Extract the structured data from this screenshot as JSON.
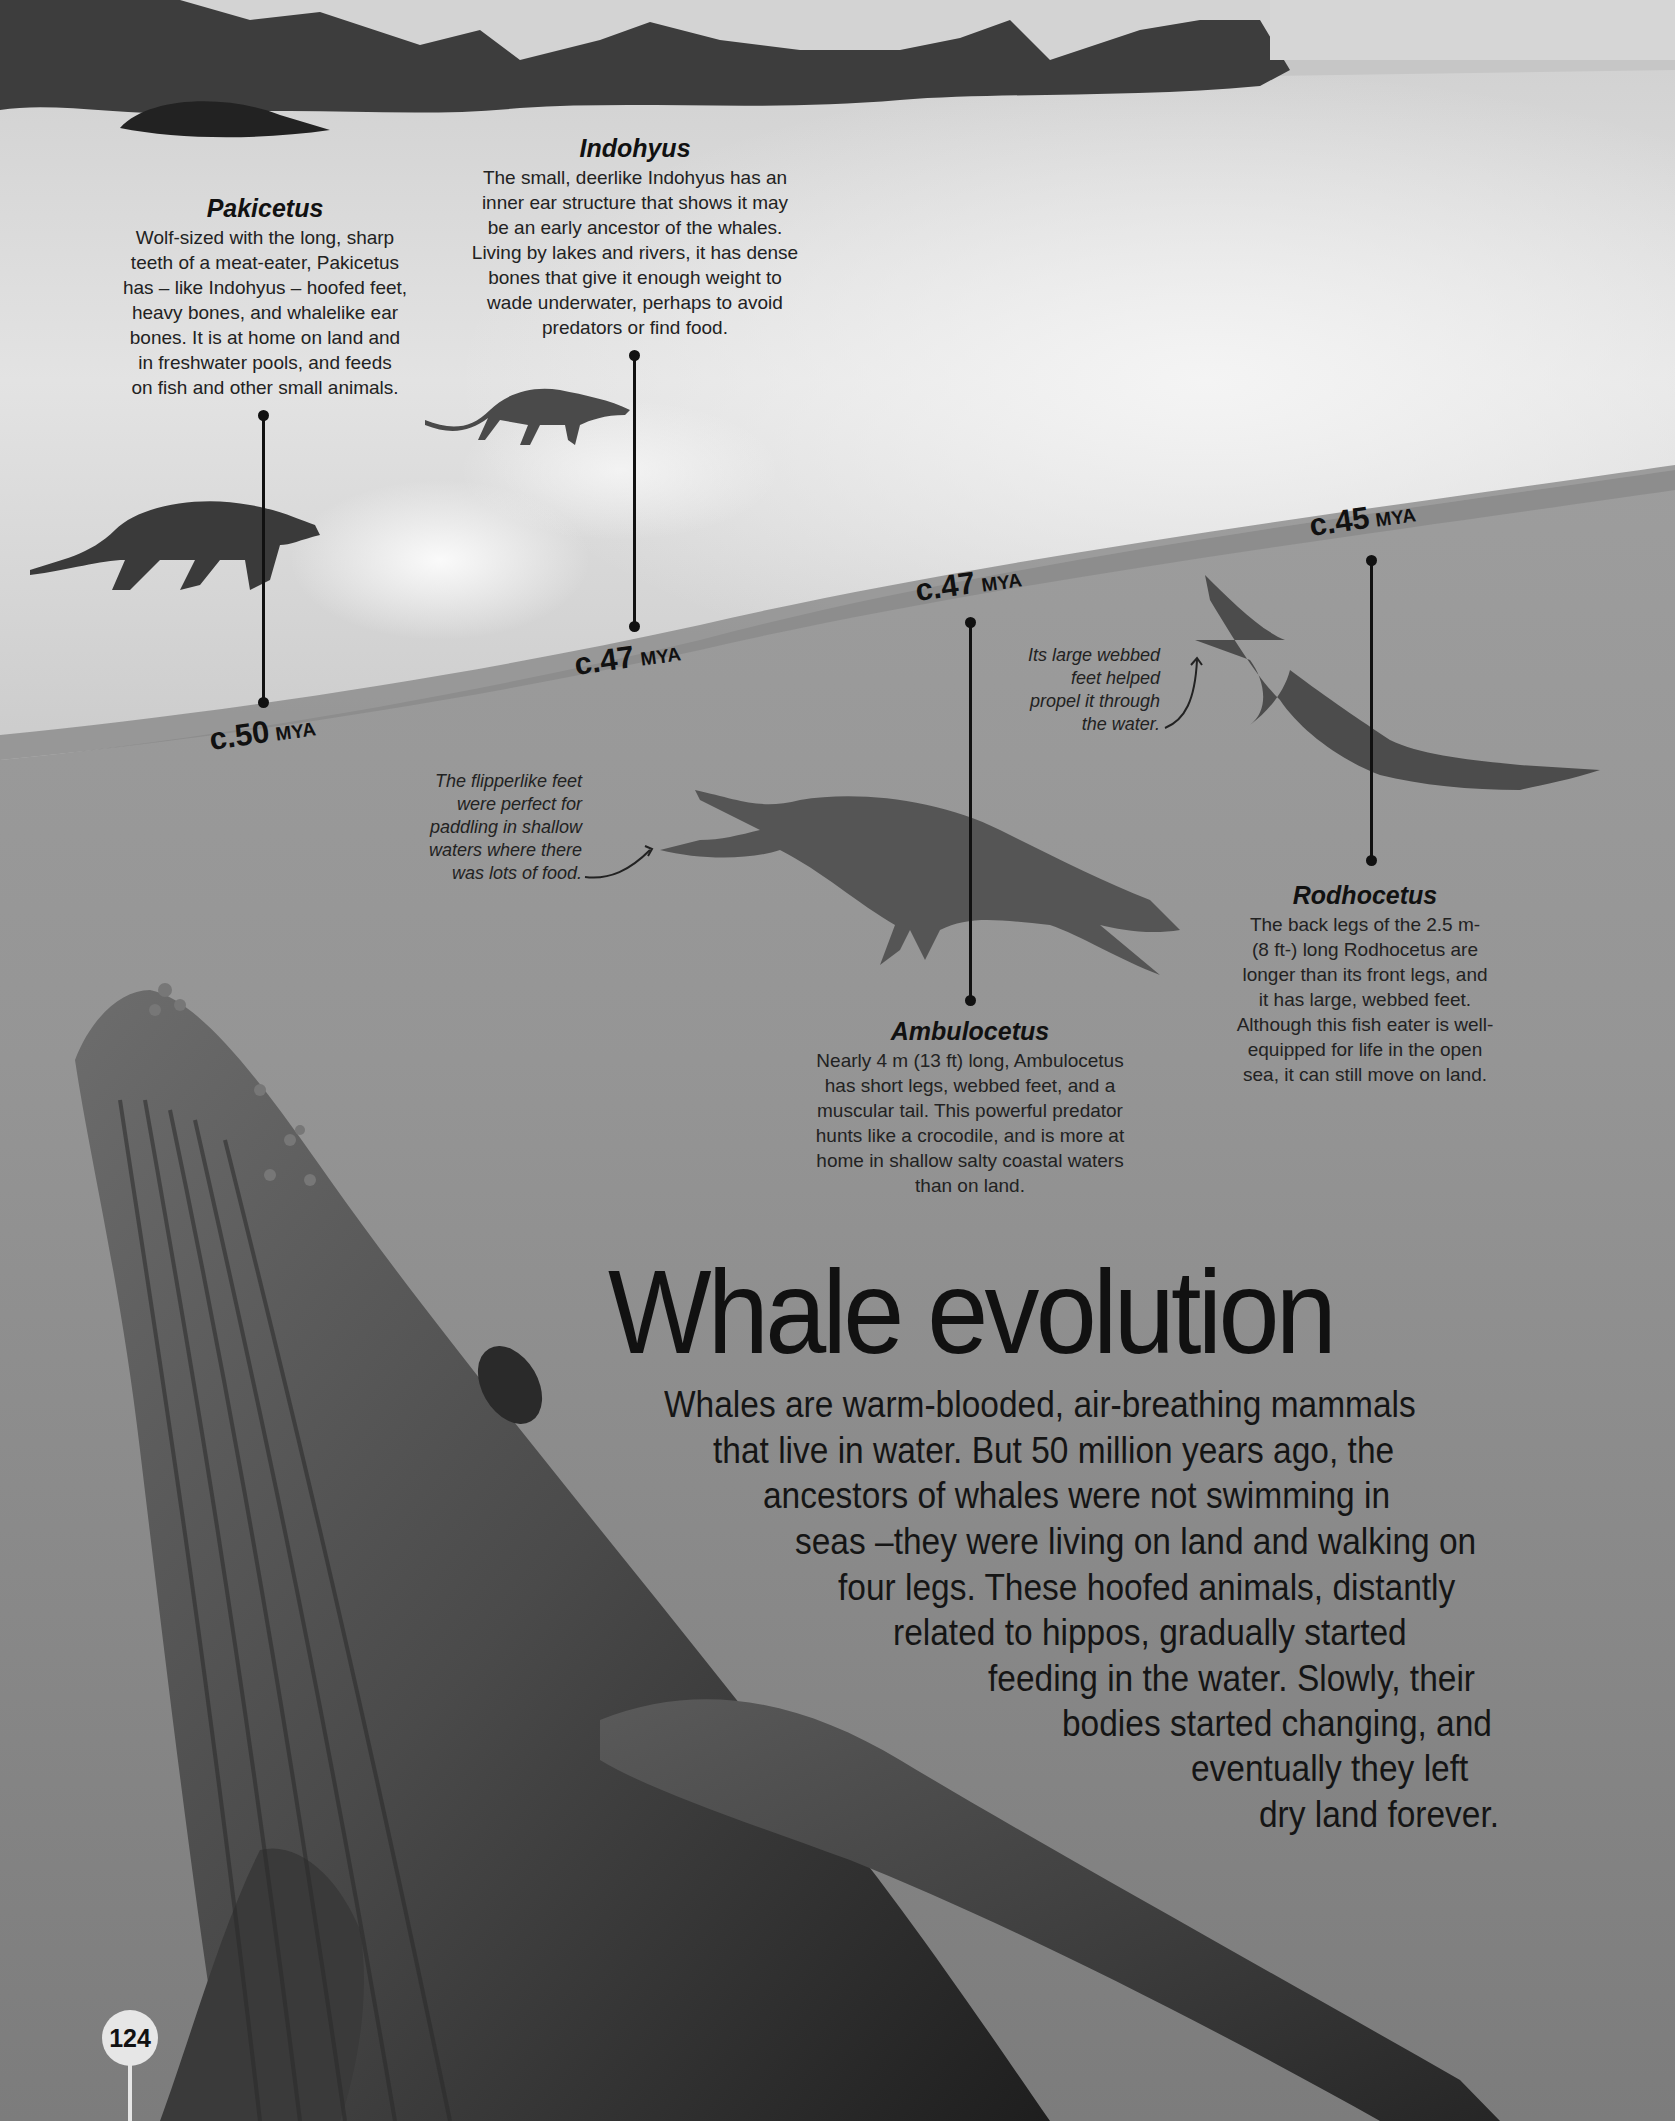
{
  "page": {
    "title": "Whale evolution",
    "page_number": "124",
    "intro_lines": [
      "Whales are warm-blooded, air-breathing mammals",
      "that live in water. But 50 million years ago, the",
      "ancestors of whales were not swimming in",
      "seas –they were living on land and walking on",
      "four legs. These hoofed animals, distantly",
      "related to hippos, gradually started",
      "feeding in the water. Slowly, their",
      "bodies started changing, and",
      "eventually they left",
      "dry land forever."
    ]
  },
  "species": [
    {
      "name": "Pakicetus",
      "date": "c.50",
      "unit": "MYA",
      "lines": [
        "Wolf-sized with the long, sharp",
        "teeth of a meat-eater, Pakicetus",
        "has – like Indohyus – hoofed feet,",
        "heavy bones, and whalelike ear",
        "bones. It is at home on land and",
        "in freshwater pools, and feeds",
        "on fish and other small animals."
      ]
    },
    {
      "name": "Indohyus",
      "date": "c.47",
      "unit": "MYA",
      "lines": [
        "The small, deerlike Indohyus has an",
        "inner ear structure that shows it may",
        "be an early ancestor of the whales.",
        "Living by lakes and rivers, it has dense",
        "bones that give it enough weight to",
        "wade underwater, perhaps to avoid",
        "predators or find food."
      ]
    },
    {
      "name": "Ambulocetus",
      "date": "c.47",
      "unit": "MYA",
      "lines": [
        "Nearly 4 m (13 ft) long, Ambulocetus",
        "has short legs, webbed feet, and a",
        "muscular tail. This powerful predator",
        "hunts like a crocodile, and is more at",
        "home in shallow salty coastal waters",
        "than on land."
      ],
      "note": [
        "The flipperlike feet",
        "were perfect for",
        "paddling in shallow",
        "waters where there",
        "was lots of food."
      ]
    },
    {
      "name": "Rodhocetus",
      "date": "c.45",
      "unit": "MYA",
      "lines": [
        "The back legs of the 2.5 m-",
        "(8 ft-) long Rodhocetus are",
        "longer than its front legs, and",
        "it has large, webbed feet.",
        "Although this fish eater is well-",
        "equipped for life in the open",
        "sea, it can still move on land."
      ],
      "note": [
        "Its large webbed",
        "feet helped",
        "propel it through",
        "the water."
      ]
    }
  ],
  "colors": {
    "text": "#1a1a1a",
    "land_dark": "#3a3a3a",
    "sand": "#d6d6d6",
    "water": "#8f8f8f",
    "page_badge": "#e6e6e6"
  }
}
